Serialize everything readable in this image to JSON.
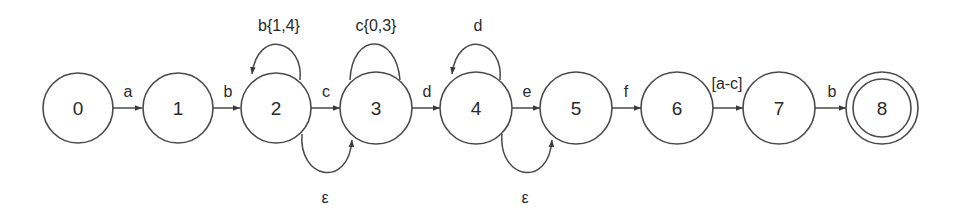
{
  "diagram": {
    "type": "finite-state-automaton",
    "colors": {
      "stroke": "#4a4a4a",
      "text": "#2a2a2a",
      "background": "#ffffff"
    },
    "states": [
      {
        "id": "0",
        "label": "0",
        "x": 78,
        "y": 108,
        "accepting": false
      },
      {
        "id": "1",
        "label": "1",
        "x": 178,
        "y": 108,
        "accepting": false
      },
      {
        "id": "2",
        "label": "2",
        "x": 276,
        "y": 108,
        "accepting": false
      },
      {
        "id": "3",
        "label": "3",
        "x": 376,
        "y": 108,
        "accepting": false
      },
      {
        "id": "4",
        "label": "4",
        "x": 476,
        "y": 108,
        "accepting": false
      },
      {
        "id": "5",
        "label": "5",
        "x": 576,
        "y": 108,
        "accepting": false
      },
      {
        "id": "6",
        "label": "6",
        "x": 677,
        "y": 108,
        "accepting": false
      },
      {
        "id": "7",
        "label": "7",
        "x": 779,
        "y": 108,
        "accepting": false
      },
      {
        "id": "8",
        "label": "8",
        "x": 882,
        "y": 108,
        "accepting": true
      }
    ],
    "transitions": [
      {
        "from": "0",
        "to": "1",
        "label": "a"
      },
      {
        "from": "1",
        "to": "2",
        "label": "b"
      },
      {
        "from": "2",
        "to": "2",
        "label": "b{1,4}",
        "kind": "self-loop"
      },
      {
        "from": "2",
        "to": "3",
        "label": "c"
      },
      {
        "from": "2",
        "to": "3",
        "label": "ε",
        "kind": "bypass-below"
      },
      {
        "from": "3",
        "to": "3",
        "label": "c{0,3}",
        "kind": "self-loop"
      },
      {
        "from": "3",
        "to": "4",
        "label": "d"
      },
      {
        "from": "4",
        "to": "4",
        "label": "d",
        "kind": "self-loop"
      },
      {
        "from": "4",
        "to": "5",
        "label": "e"
      },
      {
        "from": "4",
        "to": "5",
        "label": "ε",
        "kind": "bypass-below"
      },
      {
        "from": "5",
        "to": "6",
        "label": "f"
      },
      {
        "from": "6",
        "to": "7",
        "label": "[a-c]"
      },
      {
        "from": "7",
        "to": "8",
        "label": "b"
      }
    ]
  }
}
